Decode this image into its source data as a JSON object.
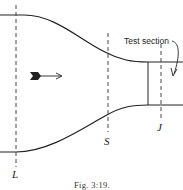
{
  "figure": {
    "caption": "Fig. 3:19.",
    "callout_label": "Test section",
    "section_labels": {
      "L": "L",
      "S": "S",
      "J": "J"
    },
    "flow_direction": "left-to-right",
    "colors": {
      "line": "#222222",
      "background": "#ffffff"
    }
  }
}
